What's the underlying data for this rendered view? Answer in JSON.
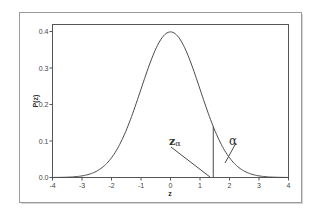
{
  "chart_data": {
    "type": "line",
    "title": "",
    "xlabel": "z",
    "ylabel": "P(z)",
    "xlim": [
      -4,
      4
    ],
    "ylim": [
      0.0,
      0.4
    ],
    "x_ticks": [
      -4,
      -3,
      -2,
      -1,
      0,
      1,
      2,
      3,
      4
    ],
    "x_tick_labels": [
      "-4",
      "-3",
      "-2",
      "-1",
      "0",
      "1",
      "2",
      "3",
      "4"
    ],
    "y_ticks": [
      0.0,
      0.1,
      0.2,
      0.3,
      0.4
    ],
    "y_tick_labels": [
      "0.0",
      "0.1",
      "0.2",
      "0.3",
      "0.4"
    ],
    "grid": false,
    "legend": null,
    "series": [
      {
        "name": "Standard normal density",
        "function": "P(z) = exp(-z^2/2)/sqrt(2*pi)",
        "x": [
          -4,
          -3.5,
          -3,
          -2.5,
          -2,
          -1.5,
          -1,
          -0.5,
          0,
          0.5,
          1,
          1.5,
          2,
          2.5,
          3,
          3.5,
          4
        ],
        "y": [
          0.0001,
          0.0009,
          0.0044,
          0.0175,
          0.054,
          0.1295,
          0.242,
          0.3521,
          0.3989,
          0.3521,
          0.242,
          0.1295,
          0.054,
          0.0175,
          0.0044,
          0.0009,
          0.0001
        ]
      }
    ],
    "annotations": [
      {
        "label": "zα",
        "type": "vertical-line",
        "x": 1.45,
        "y_top": 0.139,
        "description": "critical value marker"
      },
      {
        "label": "α",
        "type": "pointer",
        "target_x": 1.9,
        "target_y": 0.04,
        "description": "upper tail area"
      }
    ]
  },
  "labels": {
    "xlabel": "z",
    "ylabel": "P(z)",
    "z_alpha_main": "z",
    "z_alpha_sub": "α",
    "alpha": "α"
  }
}
